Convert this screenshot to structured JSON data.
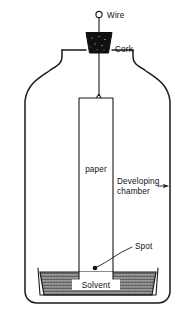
{
  "figure": {
    "background_color": "#ffffff",
    "ink_color": "#1a1a1a"
  },
  "labels": {
    "wire": "Wire",
    "cork": "Cork",
    "paper": "paper",
    "developing_chamber_line1": "Developing",
    "developing_chamber_line2": "chamber",
    "spot": "Spot",
    "solvent": "Solvent"
  },
  "parts": {
    "wire": {
      "name": "wire",
      "has_loop_top": true
    },
    "cork": {
      "name": "cork",
      "fill": "#111111",
      "shape": "trapezoid"
    },
    "paper_strip": {
      "name": "chromatography-paper",
      "fill": "#ffffff"
    },
    "jar": {
      "name": "developing-chamber-jar",
      "fill": "#ffffff"
    },
    "solvent_pool": {
      "name": "solvent-pool",
      "pattern": "cross-hatch"
    },
    "spot_marker": {
      "name": "sample-spot",
      "fill": "#111111"
    }
  }
}
